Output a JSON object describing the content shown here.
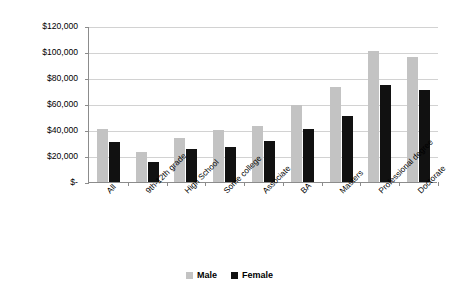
{
  "chart_data": {
    "type": "bar",
    "title": "",
    "subtitle": "",
    "xlabel": "",
    "ylabel": "",
    "grid": true,
    "legend_position": "bottom",
    "ylim": [
      0,
      120000
    ],
    "ytick_labels": [
      "$120,000",
      "$100,000",
      "$80,000",
      "$60,000",
      "$40,000",
      "$20,000",
      "$-"
    ],
    "ytick_values": [
      120000,
      100000,
      80000,
      60000,
      40000,
      20000,
      0
    ],
    "categories": [
      "All",
      "9th-12th grade",
      "High School",
      "Some college",
      "Associate",
      "BA",
      "Masters",
      "Professional degree",
      "Doctorate"
    ],
    "series": [
      {
        "name": "Male",
        "color": "#c3c3c3",
        "values": [
          41000,
          23000,
          34000,
          40000,
          43000,
          59500,
          73000,
          100500,
          96000
        ]
      },
      {
        "name": "Female",
        "color": "#111111",
        "values": [
          31000,
          15500,
          25500,
          27000,
          31500,
          41000,
          51000,
          75000,
          71000
        ]
      }
    ]
  },
  "legend": {
    "items": [
      {
        "label": "Male",
        "color": "#c3c3c3"
      },
      {
        "label": "Female",
        "color": "#111111"
      }
    ]
  },
  "colors": {
    "male": "#c3c3c3",
    "female": "#111111",
    "gridline": "#d2d2d2",
    "axis": "#8c8c8c",
    "background": "#ffffff"
  }
}
